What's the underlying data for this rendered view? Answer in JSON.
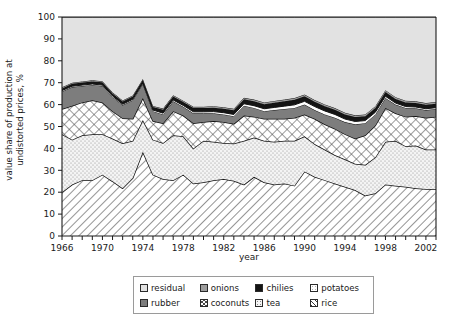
{
  "chart_data": {
    "type": "area",
    "title": "",
    "xlabel": "year",
    "ylabel_line1": "value share of production at",
    "ylabel_line2": "undistorted prices, %",
    "ylim": [
      0,
      100
    ],
    "ytick_step": 10,
    "yticks": [
      "0",
      "10",
      "20",
      "30",
      "40",
      "50",
      "60",
      "70",
      "80",
      "90",
      "100"
    ],
    "xlim": [
      1966,
      2003
    ],
    "xticks": [
      "1966",
      "1970",
      "1974",
      "1978",
      "1982",
      "1986",
      "1990",
      "1994",
      "1998",
      "2002"
    ],
    "xtick_values": [
      1966,
      1970,
      1974,
      1978,
      1982,
      1986,
      1990,
      1994,
      1998,
      2002
    ],
    "minor_tick_step": 1,
    "grid": false,
    "legend_position": "below-center",
    "stack_order_bottom_to_top": [
      "rice",
      "tea",
      "coconuts",
      "rubber",
      "potatoes",
      "chilies",
      "onions",
      "residual"
    ],
    "x": [
      1966,
      1967,
      1968,
      1969,
      1970,
      1971,
      1972,
      1973,
      1974,
      1975,
      1976,
      1977,
      1978,
      1979,
      1980,
      1981,
      1982,
      1983,
      1984,
      1985,
      1986,
      1987,
      1988,
      1989,
      1990,
      1991,
      1992,
      1993,
      1994,
      1995,
      1996,
      1997,
      1998,
      1999,
      2000,
      2001,
      2002,
      2003
    ],
    "series": [
      {
        "name": "rice",
        "pattern": "diagonal-hatch",
        "color": "#ffffff",
        "values": [
          20.0,
          23.5,
          25.5,
          25.5,
          28.0,
          25.0,
          21.8,
          26.5,
          38.5,
          28.0,
          26.0,
          25.5,
          28.0,
          24.0,
          24.5,
          25.5,
          26.0,
          25.2,
          23.5,
          27.0,
          24.5,
          23.5,
          24.0,
          23.0,
          29.5,
          27.0,
          25.5,
          24.0,
          22.5,
          21.0,
          18.5,
          19.5,
          23.5,
          23.0,
          22.5,
          21.8,
          21.5,
          21.5
        ]
      },
      {
        "name": "tea",
        "pattern": "fine-dots",
        "color": "#f2f2f2",
        "values": [
          26.5,
          20.5,
          20.5,
          21.0,
          18.5,
          19.5,
          20.5,
          17.0,
          14.5,
          16.0,
          16.5,
          20.5,
          17.5,
          16.0,
          19.0,
          17.5,
          16.5,
          17.0,
          20.0,
          18.0,
          19.0,
          19.5,
          19.5,
          20.5,
          16.0,
          15.0,
          14.0,
          13.0,
          12.5,
          12.0,
          14.0,
          16.5,
          19.5,
          20.5,
          18.5,
          19.5,
          18.0,
          18.0
        ]
      },
      {
        "name": "coconuts",
        "pattern": "crosshatch",
        "color": "#ffffff",
        "values": [
          11.5,
          15.5,
          15.0,
          15.5,
          14.5,
          12.5,
          11.5,
          10.0,
          10.0,
          8.5,
          9.0,
          11.0,
          9.5,
          11.5,
          8.5,
          9.5,
          9.5,
          9.0,
          11.5,
          9.5,
          10.0,
          10.5,
          10.0,
          10.5,
          10.0,
          11.5,
          11.5,
          12.0,
          11.5,
          11.5,
          13.5,
          14.5,
          15.5,
          12.5,
          13.5,
          13.5,
          14.5,
          15.0
        ]
      },
      {
        "name": "rubber",
        "pattern": "solid",
        "color": "#7d7d7d",
        "values": [
          8.0,
          8.5,
          7.5,
          7.0,
          7.5,
          6.5,
          6.0,
          8.5,
          6.5,
          4.5,
          4.0,
          4.5,
          4.0,
          4.5,
          4.0,
          3.5,
          3.5,
          3.5,
          4.5,
          4.0,
          3.5,
          4.0,
          4.5,
          4.5,
          4.5,
          4.0,
          4.5,
          5.0,
          5.5,
          6.5,
          5.5,
          5.0,
          4.5,
          4.0,
          4.0,
          3.5,
          3.5,
          3.5
        ]
      },
      {
        "name": "potatoes",
        "pattern": "light-dots",
        "color": "#fbfbfb",
        "values": [
          0.4,
          0.4,
          0.4,
          0.4,
          0.4,
          0.4,
          0.4,
          0.4,
          0.4,
          0.5,
          0.6,
          0.6,
          0.6,
          0.7,
          0.7,
          0.8,
          0.8,
          0.8,
          0.9,
          1.0,
          1.1,
          1.2,
          1.3,
          1.4,
          1.5,
          1.6,
          1.6,
          1.5,
          1.4,
          1.3,
          1.2,
          1.0,
          0.8,
          0.7,
          0.6,
          0.6,
          0.6,
          0.6
        ]
      },
      {
        "name": "chilies",
        "pattern": "solid",
        "color": "#141414",
        "values": [
          1.0,
          1.1,
          1.2,
          1.2,
          1.3,
          1.2,
          1.2,
          1.3,
          1.3,
          1.4,
          1.5,
          1.6,
          1.6,
          1.7,
          1.7,
          1.8,
          1.8,
          1.9,
          2.0,
          2.0,
          2.1,
          2.2,
          2.2,
          2.3,
          2.3,
          2.2,
          2.2,
          2.1,
          2.1,
          2.0,
          2.0,
          2.0,
          2.0,
          1.9,
          1.9,
          1.8,
          1.8,
          1.8
        ]
      },
      {
        "name": "onions",
        "pattern": "solid",
        "color": "#9d9d9d",
        "values": [
          0.5,
          0.5,
          0.5,
          0.5,
          0.5,
          0.5,
          0.5,
          0.5,
          0.5,
          0.5,
          0.6,
          0.6,
          0.6,
          0.6,
          0.6,
          0.7,
          0.7,
          0.7,
          0.7,
          0.8,
          0.8,
          0.8,
          0.8,
          0.8,
          0.8,
          0.8,
          0.8,
          0.8,
          0.8,
          0.8,
          0.8,
          0.8,
          0.8,
          0.8,
          0.8,
          0.8,
          0.8,
          0.8
        ]
      },
      {
        "name": "residual",
        "pattern": "solid",
        "color": "#e2e2e2",
        "values": [
          32.1,
          30.0,
          29.4,
          28.9,
          29.3,
          34.4,
          38.1,
          35.8,
          28.3,
          40.6,
          41.8,
          35.7,
          38.2,
          41.0,
          41.0,
          40.7,
          41.2,
          41.9,
          36.9,
          37.7,
          39.0,
          38.3,
          37.7,
          37.0,
          35.4,
          37.9,
          39.9,
          41.6,
          43.7,
          44.9,
          44.5,
          40.7,
          33.4,
          36.6,
          38.2,
          38.5,
          39.3,
          38.8
        ]
      }
    ]
  },
  "legend": {
    "items": [
      {
        "label": "residual",
        "key": "residual"
      },
      {
        "label": "onions",
        "key": "onions"
      },
      {
        "label": "chilies",
        "key": "chilies"
      },
      {
        "label": "potatoes",
        "key": "potatoes"
      },
      {
        "label": "rubber",
        "key": "rubber"
      },
      {
        "label": "coconuts",
        "key": "coconuts"
      },
      {
        "label": "tea",
        "key": "tea"
      },
      {
        "label": "rice",
        "key": "rice"
      }
    ]
  },
  "colors": {
    "residual": "#e2e2e2",
    "onions": "#9d9d9d",
    "chilies": "#141414",
    "potatoes": "#fbfbfb",
    "rubber": "#7d7d7d",
    "coconuts": "#ffffff",
    "tea": "#f2f2f2",
    "rice": "#ffffff",
    "axis": "#1a1a1a",
    "outline": "#111111",
    "legend_border": "#9a9a9a"
  }
}
